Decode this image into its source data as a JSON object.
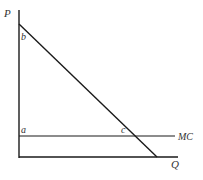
{
  "diagram": {
    "type": "economics-monopoly-demand-mc",
    "axes": {
      "y_label": "P",
      "x_label": "Q"
    },
    "curves": [
      {
        "name": "demand",
        "label": ""
      },
      {
        "name": "marginal-cost",
        "label": "MC"
      }
    ],
    "points": {
      "a": "a",
      "b": "b",
      "c": "c"
    },
    "colors": {
      "line": "#1a1a1a",
      "text": "#333333"
    }
  }
}
